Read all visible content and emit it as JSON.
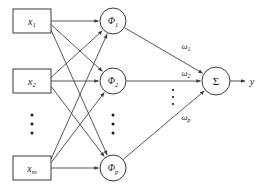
{
  "figure": {
    "stroke_color": "#3a3a3a",
    "text_color": "#1a1a1a",
    "background": "#ffffff"
  },
  "input_layer": {
    "name": "input-layer",
    "nodes": [
      {
        "id": "x1",
        "base": "x",
        "sub": "1",
        "cx": 32,
        "cy": 21,
        "w": 38,
        "h": 24
      },
      {
        "id": "x2",
        "base": "x",
        "sub": "2",
        "cx": 32,
        "cy": 81,
        "w": 38,
        "h": 24
      },
      {
        "id": "xm",
        "base": "x",
        "sub": "m",
        "cx": 32,
        "cy": 168,
        "w": 38,
        "h": 24
      }
    ],
    "ellipsis": {
      "cx": 32,
      "cy": 124,
      "dots": 3
    }
  },
  "hidden_layer": {
    "name": "hidden-layer",
    "nodes": [
      {
        "id": "phi1",
        "base": "Φ",
        "sub": "1",
        "cx": 113,
        "cy": 21,
        "r": 13
      },
      {
        "id": "phi2",
        "base": "Φ",
        "sub": "2",
        "cx": 113,
        "cy": 81,
        "r": 13
      },
      {
        "id": "phip",
        "base": "Φ",
        "sub": "p",
        "cx": 113,
        "cy": 168,
        "r": 13
      }
    ],
    "ellipsis": {
      "cx": 113,
      "cy": 124,
      "dots": 3
    }
  },
  "output_node": {
    "id": "sigma",
    "label": "Σ",
    "cx": 216,
    "cy": 81,
    "r": 14
  },
  "output": {
    "label": "y",
    "x": 252,
    "y": 81,
    "arrow_from_x": 230,
    "arrow_to_x": 245
  },
  "weights": [
    {
      "id": "w1",
      "base": "ω",
      "sub": "1",
      "x": 186,
      "y": 49
    },
    {
      "id": "w2",
      "base": "ω",
      "sub": "2",
      "x": 186,
      "y": 76
    },
    {
      "id": "wp",
      "base": "ω",
      "sub": "p",
      "x": 186,
      "y": 120
    }
  ],
  "weights_ellipsis": {
    "cx": 173,
    "cy": 97,
    "dots": 3
  },
  "edges_input_to_hidden": [
    {
      "from": "x1",
      "to": "phi1"
    },
    {
      "from": "x1",
      "to": "phi2"
    },
    {
      "from": "x1",
      "to": "phip"
    },
    {
      "from": "x2",
      "to": "phi1"
    },
    {
      "from": "x2",
      "to": "phi2"
    },
    {
      "from": "x2",
      "to": "phip"
    },
    {
      "from": "xm",
      "to": "phi1"
    },
    {
      "from": "xm",
      "to": "phi2"
    },
    {
      "from": "xm",
      "to": "phip"
    }
  ],
  "edges_hidden_to_output": [
    {
      "from": "phi1",
      "to": "sigma",
      "weight": "w1"
    },
    {
      "from": "phi2",
      "to": "sigma",
      "weight": "w2"
    },
    {
      "from": "phip",
      "to": "sigma",
      "weight": "wp"
    }
  ]
}
